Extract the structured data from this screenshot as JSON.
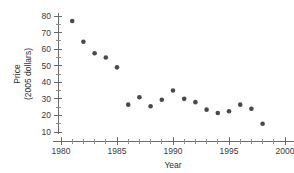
{
  "chart_data": {
    "type": "scatter",
    "title": "",
    "xlabel": "Year",
    "ylabel": "Price\n(2005 dollars)",
    "ylabel_line1": "Price",
    "ylabel_line2": "(2005 dollars)",
    "xlim": [
      1979,
      2001
    ],
    "ylim": [
      8,
      82
    ],
    "x_ticks": [
      1980,
      1985,
      1990,
      1995,
      2000
    ],
    "x_tick_labels": [
      "1980",
      "1985",
      "1990",
      "1995",
      "2000"
    ],
    "x_minor_ticks": [
      1981,
      1982,
      1983,
      1984,
      1986,
      1987,
      1988,
      1989,
      1991,
      1992,
      1993,
      1994,
      1996,
      1997,
      1998,
      1999
    ],
    "y_ticks": [
      10,
      20,
      30,
      40,
      50,
      60,
      70,
      80
    ],
    "y_tick_labels": [
      "10",
      "20",
      "30",
      "40",
      "50",
      "60",
      "70",
      "80"
    ],
    "y_minor_ticks": [
      15,
      25,
      35,
      45,
      55,
      65,
      75
    ],
    "grid": false,
    "legend": false,
    "marker": "circle",
    "marker_color": "#4a4a4a",
    "x": [
      1981,
      1982,
      1983,
      1984,
      1985,
      1986,
      1987,
      1988,
      1989,
      1990,
      1991,
      1992,
      1993,
      1994,
      1995,
      1996,
      1997,
      1998
    ],
    "values": [
      77,
      64.5,
      57.5,
      55,
      49,
      26.5,
      31,
      25.5,
      29.5,
      35,
      30,
      28,
      23.5,
      21.5,
      22.5,
      26.5,
      24,
      15
    ],
    "points": [
      {
        "x": 1981,
        "y": 77
      },
      {
        "x": 1982,
        "y": 64.5
      },
      {
        "x": 1983,
        "y": 57.5
      },
      {
        "x": 1984,
        "y": 55
      },
      {
        "x": 1985,
        "y": 49
      },
      {
        "x": 1986,
        "y": 26.5
      },
      {
        "x": 1987,
        "y": 31
      },
      {
        "x": 1988,
        "y": 25.5
      },
      {
        "x": 1989,
        "y": 29.5
      },
      {
        "x": 1990,
        "y": 35
      },
      {
        "x": 1991,
        "y": 30
      },
      {
        "x": 1992,
        "y": 28
      },
      {
        "x": 1993,
        "y": 23.5
      },
      {
        "x": 1994,
        "y": 21.5
      },
      {
        "x": 1995,
        "y": 22.5
      },
      {
        "x": 1996,
        "y": 26.5
      },
      {
        "x": 1997,
        "y": 24
      },
      {
        "x": 1998,
        "y": 15
      }
    ]
  }
}
